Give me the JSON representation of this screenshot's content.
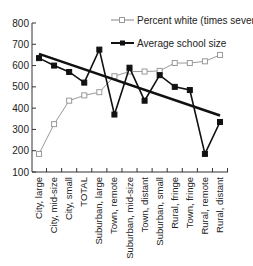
{
  "chart_data": {
    "type": "line",
    "title": "",
    "xlabel": "",
    "ylabel": "",
    "ylim": [
      100,
      800
    ],
    "yticks": [
      100,
      200,
      300,
      400,
      500,
      600,
      700,
      800
    ],
    "grid": false,
    "legend_position": "top-right",
    "categories": [
      "City, large",
      "City, mid-size",
      "City, small",
      "TOTAL",
      "Suburban, large",
      "Town, remote",
      "Suburban, mid-size",
      "Town, distant",
      "Suburban, small",
      "Rural, fringe",
      "Town, fringe",
      "Rural, remote",
      "Rural, distant"
    ],
    "series": [
      {
        "name": "Percent white (times seven)",
        "marker": "open-square",
        "color": "#999999",
        "values": [
          185,
          325,
          435,
          460,
          475,
          550,
          572,
          572,
          575,
          612,
          612,
          620,
          650
        ]
      },
      {
        "name": "Average school size",
        "marker": "filled-square",
        "color": "#111111",
        "values": [
          635,
          600,
          570,
          520,
          675,
          370,
          590,
          435,
          555,
          500,
          485,
          185,
          335
        ]
      }
    ],
    "trendline": {
      "series": "Average school size",
      "start": 655,
      "end": 365,
      "color": "#111111"
    }
  },
  "legend": {
    "items": [
      {
        "label": "Percent white (times seven)"
      },
      {
        "label": "Average school size"
      }
    ]
  }
}
